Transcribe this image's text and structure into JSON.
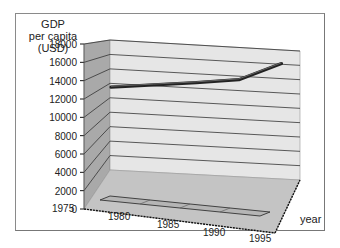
{
  "chart_data": {
    "type": "line",
    "style": "3d",
    "title": "",
    "ylabel": "GDP per capita (USD)",
    "ylabel_lines": [
      "GDP",
      "per capita",
      "(USD)"
    ],
    "xlabel": "year",
    "x": [
      1975,
      1980,
      1985,
      1990,
      1995
    ],
    "series": [
      {
        "name": "GDP per capita",
        "values": [
          12500,
          13300,
          14100,
          15000,
          17500
        ]
      }
    ],
    "yticks": [
      0,
      2000,
      4000,
      6000,
      8000,
      10000,
      12000,
      14000,
      16000,
      18000
    ],
    "ylim": [
      0,
      18000
    ],
    "grid": true,
    "legend": null
  },
  "colors": {
    "back_wall": "#e6e6e6",
    "side_wall": "#a9a9a9",
    "floor": "#c4c4c4",
    "gridline": "#333333",
    "series_line": "#444444",
    "text": "#222222"
  }
}
